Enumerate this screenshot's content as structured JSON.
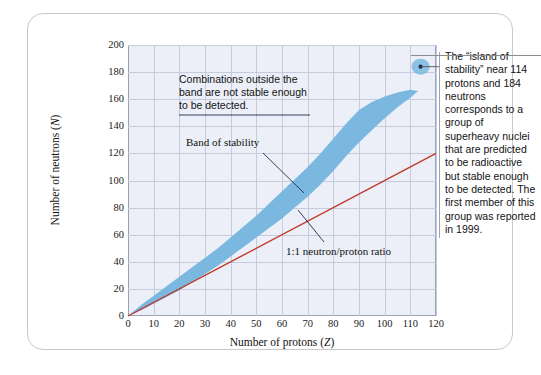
{
  "chart_data": {
    "type": "area",
    "title": "",
    "xlabel": "Number of protons (Z)",
    "xlabel_plain": "Number of protons (",
    "xlabel_symbol": "Z",
    "ylabel": "Number of neutrons (N)",
    "ylabel_plain": "Number of neutrons (",
    "ylabel_symbol": "N",
    "xlim": [
      0,
      120
    ],
    "ylim": [
      0,
      200
    ],
    "xticks": [
      0,
      10,
      20,
      30,
      40,
      50,
      60,
      70,
      80,
      90,
      100,
      110,
      120
    ],
    "yticks": [
      0,
      20,
      40,
      60,
      80,
      100,
      120,
      140,
      160,
      180,
      200
    ],
    "grid": true,
    "legend": "none",
    "series": [
      {
        "name": "Band of stability",
        "type": "band",
        "color": "#7bb8e0",
        "upper": [
          [
            0,
            0
          ],
          [
            5,
            8
          ],
          [
            10,
            15
          ],
          [
            15,
            22
          ],
          [
            20,
            29
          ],
          [
            25,
            36
          ],
          [
            30,
            43
          ],
          [
            35,
            50
          ],
          [
            40,
            58
          ],
          [
            45,
            66
          ],
          [
            50,
            74
          ],
          [
            55,
            83
          ],
          [
            60,
            92
          ],
          [
            65,
            101
          ],
          [
            70,
            110
          ],
          [
            75,
            120
          ],
          [
            80,
            131
          ],
          [
            85,
            142
          ],
          [
            90,
            152
          ],
          [
            95,
            158
          ],
          [
            100,
            162
          ],
          [
            105,
            165
          ],
          [
            110,
            167
          ],
          [
            113,
            166
          ]
        ],
        "lower": [
          [
            0,
            0
          ],
          [
            5,
            4
          ],
          [
            10,
            9
          ],
          [
            15,
            14
          ],
          [
            20,
            19
          ],
          [
            25,
            25
          ],
          [
            30,
            31
          ],
          [
            35,
            37
          ],
          [
            40,
            44
          ],
          [
            45,
            51
          ],
          [
            50,
            58
          ],
          [
            55,
            65
          ],
          [
            60,
            72
          ],
          [
            65,
            80
          ],
          [
            70,
            88
          ],
          [
            75,
            97
          ],
          [
            80,
            107
          ],
          [
            85,
            118
          ],
          [
            90,
            128
          ],
          [
            95,
            137
          ],
          [
            100,
            146
          ],
          [
            105,
            154
          ],
          [
            110,
            161
          ],
          [
            113,
            166
          ]
        ]
      },
      {
        "name": "1:1 neutron/proton ratio",
        "type": "line",
        "color": "#c0392b",
        "points": [
          [
            0,
            0
          ],
          [
            120,
            120
          ]
        ]
      },
      {
        "name": "island of stability",
        "type": "point",
        "color": "#7bb8e0",
        "dot_color": "#1d2b4a",
        "x": 114,
        "y": 184
      }
    ],
    "annotations": [
      {
        "id": "outside-band-note",
        "text": "Combinations outside the band are not stable enough to be detected.",
        "lines": [
          "Combinations outside the",
          "band are not stable enough",
          "to be detected."
        ]
      },
      {
        "id": "band-label",
        "text": "Band of stability"
      },
      {
        "id": "ratio-label",
        "text": "1:1 neutron/proton ratio"
      },
      {
        "id": "island-note",
        "text": "The “island of stability” near 114 protons and 184 neutrons corresponds to a group of superheavy nuclei that are predicted to be radioactive but stable enough to be detected. The first member of this group was reported in 1999."
      }
    ]
  },
  "colors": {
    "band": "#7bb8e0",
    "ratio_line": "#c0392b",
    "plot_background": "#eceff7",
    "grid": "#c3cbdd",
    "axis": "#9aa3b5",
    "card_border": "#c9c9c9",
    "text": "#131313"
  }
}
